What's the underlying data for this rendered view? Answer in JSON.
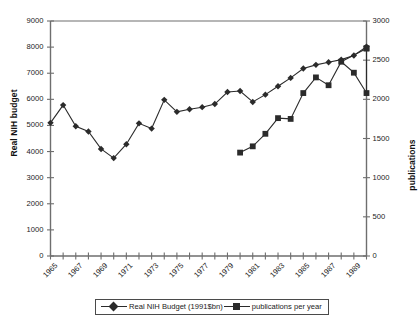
{
  "chart_data": {
    "type": "line",
    "title": "",
    "xlabel": "",
    "ylabel": "Real NIH budget",
    "y2label": "publications",
    "grid": false,
    "legend_position": "bottom",
    "x": [
      1965,
      1966,
      1967,
      1968,
      1969,
      1970,
      1971,
      1972,
      1973,
      1974,
      1975,
      1976,
      1977,
      1978,
      1979,
      1980,
      1981,
      1982,
      1983,
      1984,
      1985,
      1986,
      1987,
      1988,
      1989,
      1990
    ],
    "x_tick_labels": [
      "1965",
      "1967",
      "1969",
      "1971",
      "1973",
      "1975",
      "1977",
      "1979",
      "1981",
      "1983",
      "1985",
      "1987",
      "1989"
    ],
    "ylim": [
      0,
      9000
    ],
    "y_tick_labels": [
      "0",
      "1000",
      "2000",
      "3000",
      "4000",
      "5000",
      "6000",
      "7000",
      "8000",
      "9000"
    ],
    "y2lim": [
      0,
      3000
    ],
    "y2_tick_labels": [
      "0",
      "500",
      "1000",
      "1500",
      "2000",
      "2500",
      "3000"
    ],
    "series": [
      {
        "name": "Real NIH Budget (1991$bn)",
        "axis": "left",
        "marker": "diamond",
        "color": "#2b2b2b",
        "x": [
          1965,
          1966,
          1967,
          1968,
          1969,
          1970,
          1971,
          1972,
          1973,
          1974,
          1975,
          1976,
          1977,
          1978,
          1979,
          1980,
          1981,
          1982,
          1983,
          1984,
          1985,
          1986,
          1987,
          1988,
          1989,
          1990
        ],
        "values": [
          5100,
          5780,
          4970,
          4770,
          4100,
          3750,
          4280,
          5080,
          4880,
          5980,
          5520,
          5620,
          5700,
          5820,
          6280,
          6320,
          5900,
          6180,
          6500,
          6820,
          7180,
          7320,
          7420,
          7520,
          7680,
          8020
        ]
      },
      {
        "name": "publications per year",
        "axis": "right",
        "marker": "square",
        "color": "#2b2b2b",
        "x": [
          1980,
          1981,
          1982,
          1983,
          1984,
          1985,
          1986,
          1987,
          1988,
          1989,
          1990
        ],
        "values": [
          1320,
          1400,
          1560,
          1760,
          1750,
          2080,
          2280,
          2180,
          2480,
          2340,
          2080
        ]
      },
      {
        "name": "publications per year (continued)",
        "axis": "right",
        "marker": "square",
        "color": "#2b2b2b",
        "x": [
          1990
        ],
        "values": [
          2650
        ]
      }
    ]
  },
  "legend": {
    "items": [
      {
        "label": "Real NIH Budget (1991$bn)",
        "marker": "diamond"
      },
      {
        "label": "publications per year",
        "marker": "square"
      }
    ]
  }
}
